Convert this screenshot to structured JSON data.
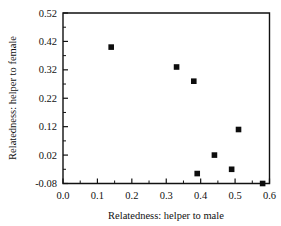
{
  "chart_data": {
    "type": "scatter",
    "title": "",
    "xlabel": "Relatedness: helper to male",
    "ylabel": "Relatedness: helper to female",
    "xlim": [
      0.0,
      0.6
    ],
    "ylim": [
      -0.08,
      0.52
    ],
    "grid": false,
    "legend": "none",
    "marker": "filled-square",
    "marker_color": "#0d0d0d",
    "xticks": [
      "0.0",
      "0.1",
      "0.2",
      "0.3",
      "0.4",
      "0.5",
      "0.6"
    ],
    "xtick_values": [
      0.0,
      0.1,
      0.2,
      0.3,
      0.4,
      0.5,
      0.6
    ],
    "yticks": [
      "0.52",
      "0.42",
      "0.32",
      "0.22",
      "0.12",
      "0.02",
      "-0.08"
    ],
    "ytick_values": [
      0.52,
      0.42,
      0.32,
      0.22,
      0.12,
      0.02,
      -0.08
    ],
    "x": [
      0.14,
      0.33,
      0.38,
      0.39,
      0.44,
      0.49,
      0.51,
      0.58
    ],
    "y": [
      0.4,
      0.33,
      0.28,
      -0.045,
      0.02,
      -0.03,
      0.11,
      -0.08
    ],
    "points": [
      {
        "x": 0.14,
        "y": 0.4
      },
      {
        "x": 0.33,
        "y": 0.33
      },
      {
        "x": 0.38,
        "y": 0.28
      },
      {
        "x": 0.39,
        "y": -0.045
      },
      {
        "x": 0.44,
        "y": 0.02
      },
      {
        "x": 0.49,
        "y": -0.03
      },
      {
        "x": 0.51,
        "y": 0.11
      },
      {
        "x": 0.58,
        "y": -0.08
      }
    ]
  }
}
